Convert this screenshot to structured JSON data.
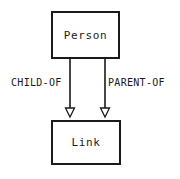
{
  "diagram": {
    "type": "entity-relationship",
    "background_color": "#ffffff",
    "line_color": "#1a1a1a",
    "nodes": [
      {
        "id": "person",
        "label": "Person",
        "shape": "rectangle"
      },
      {
        "id": "link",
        "label": "Link",
        "shape": "rectangle"
      }
    ],
    "edges": [
      {
        "id": "child-of",
        "label": "CHILD-OF",
        "from": "person",
        "to": "link",
        "arrow": "open-triangle",
        "direction": "down"
      },
      {
        "id": "parent-of",
        "label": "PARENT-OF",
        "from": "person",
        "to": "link",
        "arrow": "open-triangle",
        "direction": "down"
      }
    ]
  }
}
